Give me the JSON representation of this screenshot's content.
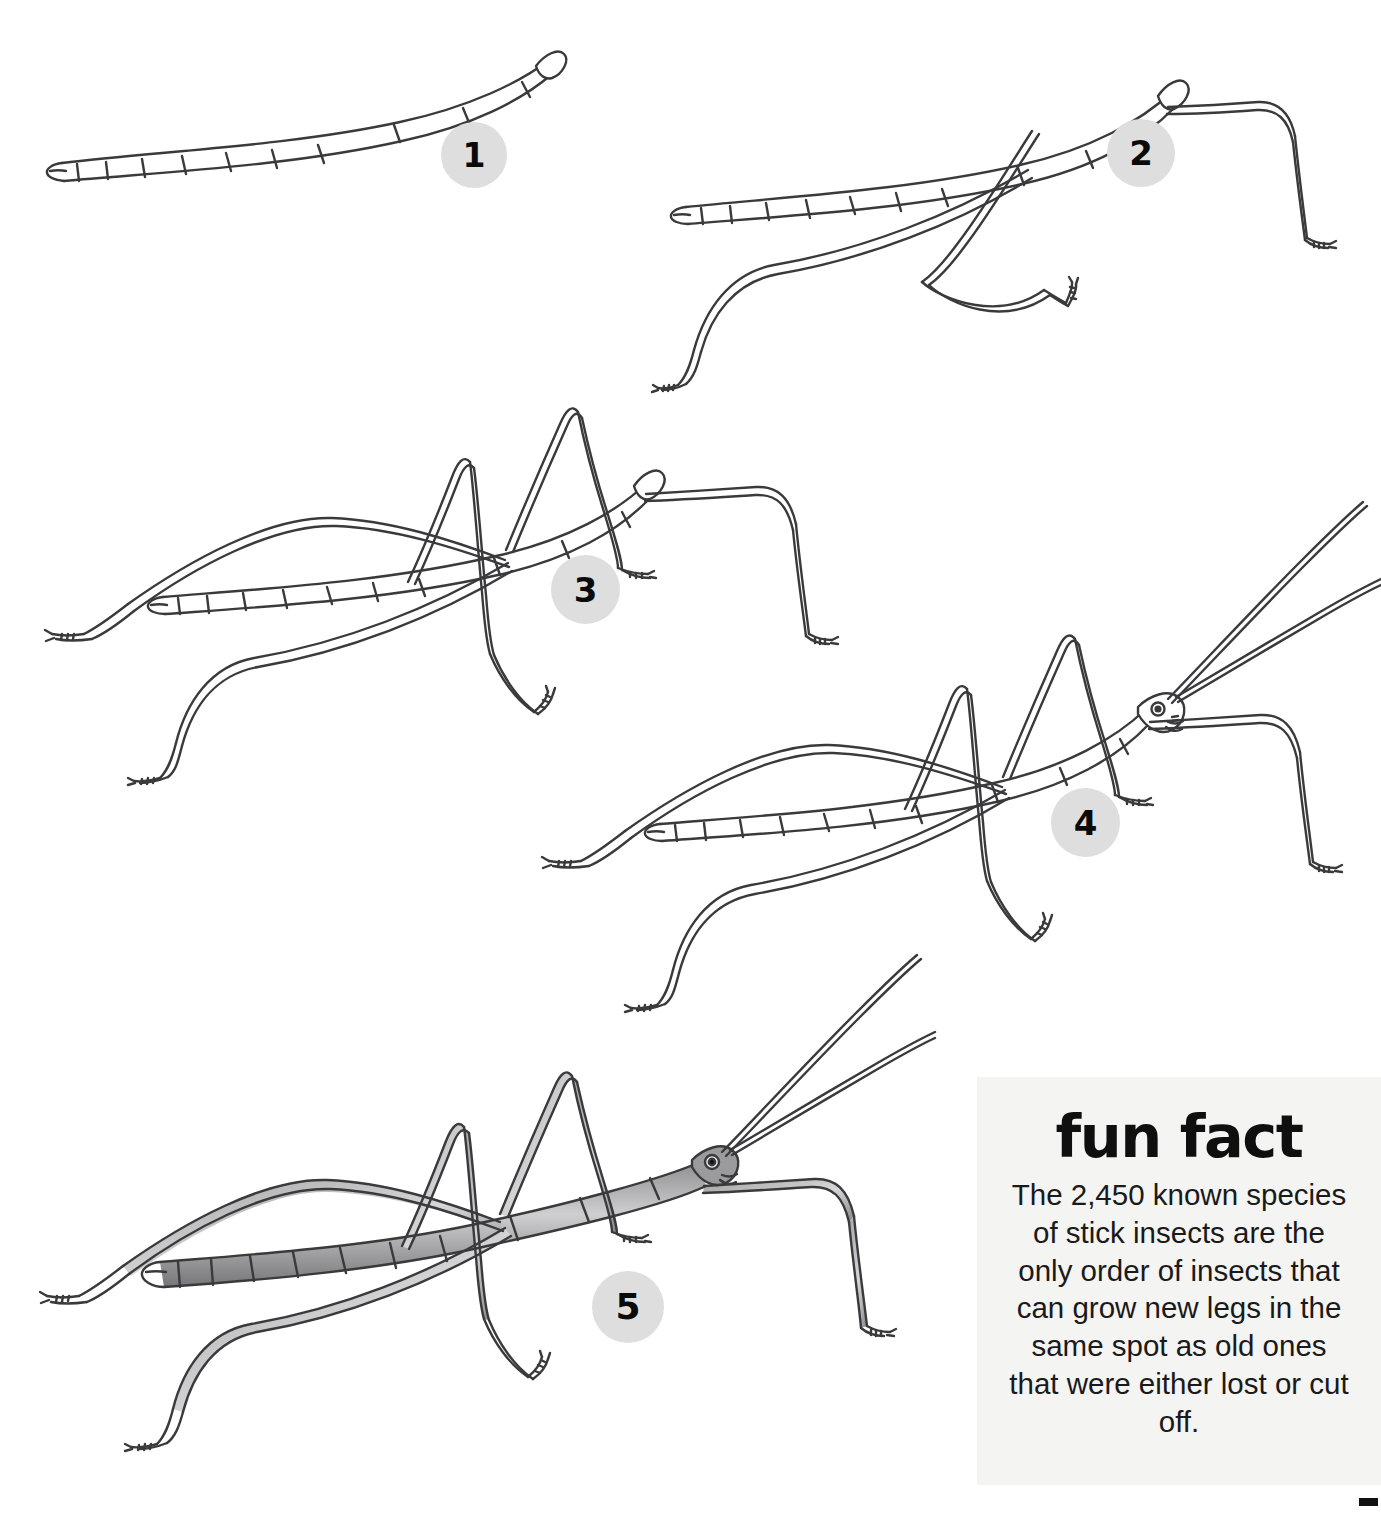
{
  "page": {
    "background_color": "#ffffff",
    "width": 1381,
    "height": 1514
  },
  "steps": [
    {
      "number": "1",
      "caption": "Segmented body outline with tapered abdomen tip and small head",
      "badge_color": "#dedede"
    },
    {
      "number": "2",
      "caption": "Add the three near-side legs",
      "badge_color": "#dedede"
    },
    {
      "number": "3",
      "caption": "Add the far-side legs to complete all six legs",
      "badge_color": "#dedede"
    },
    {
      "number": "4",
      "caption": "Add the two long antennae and detail the head and eye",
      "badge_color": "#dedede"
    },
    {
      "number": "5",
      "caption": "Shade the body and legs to finish",
      "badge_color": "#dedede"
    }
  ],
  "fun_fact": {
    "title": "fun fact",
    "body": "The 2,450 known species of stick insects are the only order of insects that can grow new legs in the same spot as old ones that were either lost or cut off.",
    "background_color": "#f4f4f2",
    "text_color": "#1a1a1a"
  },
  "line_art": {
    "stroke_color": "#3a3a3c",
    "fill_color": "#ffffff",
    "shaded_fill": "#b9b9bb"
  }
}
